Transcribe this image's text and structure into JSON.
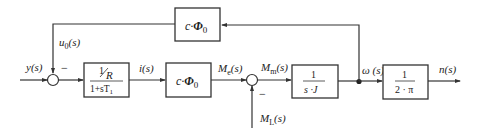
{
  "diagram": {
    "type": "control-block-diagram",
    "signals": {
      "input": "y(s)",
      "feedback": "u",
      "feedback_sub": "0",
      "feedback_suffix": "(s)",
      "current": "i(s)",
      "electric_torque": "M",
      "electric_torque_sub": "e",
      "electric_torque_suffix": "(s)",
      "motor_torque": "M",
      "motor_torque_sub": "m",
      "motor_torque_suffix": "(s)",
      "load_torque": "M",
      "load_torque_sub": "L",
      "load_torque_suffix": "(s)",
      "angular_velocity": "ω (s)",
      "output": "n(s)"
    },
    "sum_junctions": [
      {
        "id": "sum1",
        "minus_sign": "−"
      },
      {
        "id": "sum2",
        "minus_sign": "−"
      }
    ],
    "blocks": {
      "electrical": {
        "num_one": "1",
        "num_den": "R",
        "den": "1+sT",
        "den_sub": "1"
      },
      "torque_constant": {
        "coef": "c·",
        "flux": "Φ",
        "flux_sub": "0"
      },
      "inertia": {
        "num": "1",
        "den": "s ·J"
      },
      "speed_conversion": {
        "num": "1",
        "den": "2 · π"
      },
      "back_emf": {
        "coef": "c·",
        "flux": "Φ",
        "flux_sub": "0"
      }
    }
  }
}
